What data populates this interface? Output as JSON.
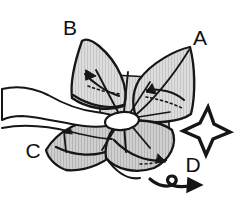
{
  "figure": {
    "type": "origami-instruction-diagram",
    "style": "hand-drawn pencil sketch, grayscale",
    "background_color": "#ffffff",
    "ink_color": "#161616",
    "paper_fill_color": "#d9d9d9",
    "paper_shade_color": "#c3c3c3",
    "hand_fill_color": "#ffffff"
  },
  "labels": [
    {
      "id": "B",
      "text": "B",
      "x": 78,
      "y": 28,
      "refers_to": "upper-left-petal"
    },
    {
      "id": "A",
      "text": "A",
      "x": 196,
      "y": 45,
      "refers_to": "upper-right-petal"
    },
    {
      "id": "C",
      "text": "C",
      "x": 28,
      "y": 158,
      "refers_to": "lower-left-petal"
    },
    {
      "id": "D",
      "text": "D",
      "x": 191,
      "y": 166,
      "refers_to": "push-star-symbol"
    }
  ],
  "symbols": [
    {
      "name": "push-star-symbol",
      "meaning": "push / press here",
      "shape": "four-pointed concave star outline",
      "center_x": 206,
      "center_y": 128
    },
    {
      "name": "turn-over-arrow",
      "meaning": "turn the model over / rotate",
      "shape": "right-pointing arrow with small loop at tail",
      "center_x": 175,
      "center_y": 182
    }
  ],
  "petals": [
    {
      "name": "petal-b",
      "position": "upper-left",
      "label": "B"
    },
    {
      "name": "petal-a",
      "position": "upper-right",
      "label": "A"
    },
    {
      "name": "petal-c",
      "position": "lower-left",
      "label": "C"
    },
    {
      "name": "petal-d",
      "position": "lower-right",
      "label": "D"
    }
  ],
  "hand": {
    "name": "holding-hand",
    "description": "fingers entering from the left edge, thumb and fingertip pinching the centre of the model"
  }
}
